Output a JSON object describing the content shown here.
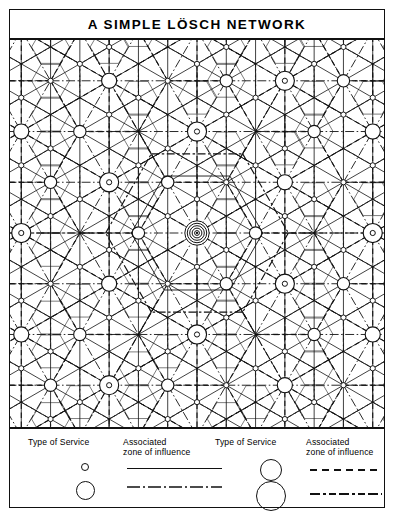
{
  "figure": {
    "title": "A SIMPLE LÖSCH NETWORK",
    "type": "central-place-network-diagram"
  },
  "legend": {
    "columns": [
      {
        "service_header": "Type of Service",
        "zone_header_line1": "Associated",
        "zone_header_line2": "zone of influence",
        "rows": [
          {
            "marker": "small-circle",
            "marker_diameter_px": 8,
            "line_style": "solid"
          },
          {
            "marker": "medium-circle",
            "marker_diameter_px": 18,
            "line_style": "dash-dot"
          }
        ]
      },
      {
        "service_header": "Type of Service",
        "zone_header_line1": "Associated",
        "zone_header_line2": "zone of influence",
        "rows": [
          {
            "marker": "large-circle",
            "marker_diameter_px": 22,
            "line_style": "dashed"
          },
          {
            "marker": "xlarge-circle",
            "marker_diameter_px": 29,
            "line_style": "long-dash-dot"
          }
        ]
      }
    ]
  },
  "chart_data": {
    "type": "diagram",
    "title": "A SIMPLE LÖSCH NETWORK",
    "hierarchy_levels": 4,
    "center_node": {
      "x": 188,
      "y": 194,
      "rings": 5,
      "order": "highest"
    },
    "colors": {
      "ink": "#111111",
      "background": "#ffffff"
    },
    "line_styles": [
      "solid",
      "dash-dot",
      "dashed",
      "long-dash-dot"
    ],
    "node_orders": [
      {
        "order": 1,
        "marker": "small-circle",
        "zone": "solid"
      },
      {
        "order": 2,
        "marker": "medium-circle",
        "zone": "dash-dot"
      },
      {
        "order": 3,
        "marker": "large-circle",
        "zone": "dashed"
      },
      {
        "order": 4,
        "marker": "xlarge-circle",
        "zone": "long-dash-dot"
      }
    ]
  }
}
